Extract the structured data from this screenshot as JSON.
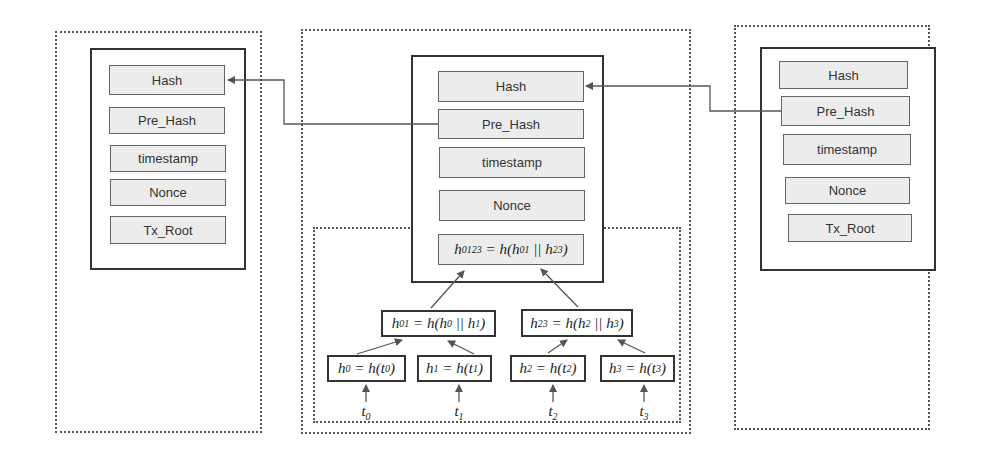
{
  "blocks": [
    {
      "id": "prev",
      "fields": [
        "Hash",
        "Pre_Hash",
        "timestamp",
        "Nonce",
        "Tx_Root"
      ]
    },
    {
      "id": "current",
      "fields": [
        "Hash",
        "Pre_Hash",
        "timestamp",
        "Nonce"
      ],
      "merkle_root": {
        "lhs": "h",
        "lhs_sub": "0123",
        "eq": " = h(",
        "a": "h",
        "a_sub": "01",
        "sep": " || ",
        "b": "h",
        "b_sub": "23",
        "close": ")"
      }
    },
    {
      "id": "next",
      "fields": [
        "Hash",
        "Pre_Hash",
        "timestamp",
        "Nonce",
        "Tx_Root"
      ]
    }
  ],
  "merkle_tree": {
    "level1": [
      {
        "lhs": "h",
        "lhs_sub": "01",
        "eq": " = h(",
        "a": "h",
        "a_sub": "0",
        "sep": " || ",
        "b": "h",
        "b_sub": "1",
        "close": ")"
      },
      {
        "lhs": "h",
        "lhs_sub": "23",
        "eq": " = h(",
        "a": "h",
        "a_sub": "2",
        "sep": " || ",
        "b": "h",
        "b_sub": "3",
        "close": ")"
      }
    ],
    "leaves": [
      {
        "lhs": "h",
        "lhs_sub": "0",
        "eq": " = h(",
        "a": "t",
        "a_sub": "0",
        "close": ")"
      },
      {
        "lhs": "h",
        "lhs_sub": "1",
        "eq": " = h(",
        "a": "t",
        "a_sub": "1",
        "close": ")"
      },
      {
        "lhs": "h",
        "lhs_sub": "2",
        "eq": " = h(",
        "a": "t",
        "a_sub": "2",
        "close": ")"
      },
      {
        "lhs": "h",
        "lhs_sub": "3",
        "eq": " = h(",
        "a": "t",
        "a_sub": "3",
        "close": ")"
      }
    ],
    "transactions": [
      {
        "name": "t",
        "sub": "0"
      },
      {
        "name": "t",
        "sub": "1"
      },
      {
        "name": "t",
        "sub": "2"
      },
      {
        "name": "t",
        "sub": "3"
      }
    ]
  },
  "colors": {
    "field_fill": "#ececec",
    "border": "#333333",
    "arrow": "#555555"
  }
}
